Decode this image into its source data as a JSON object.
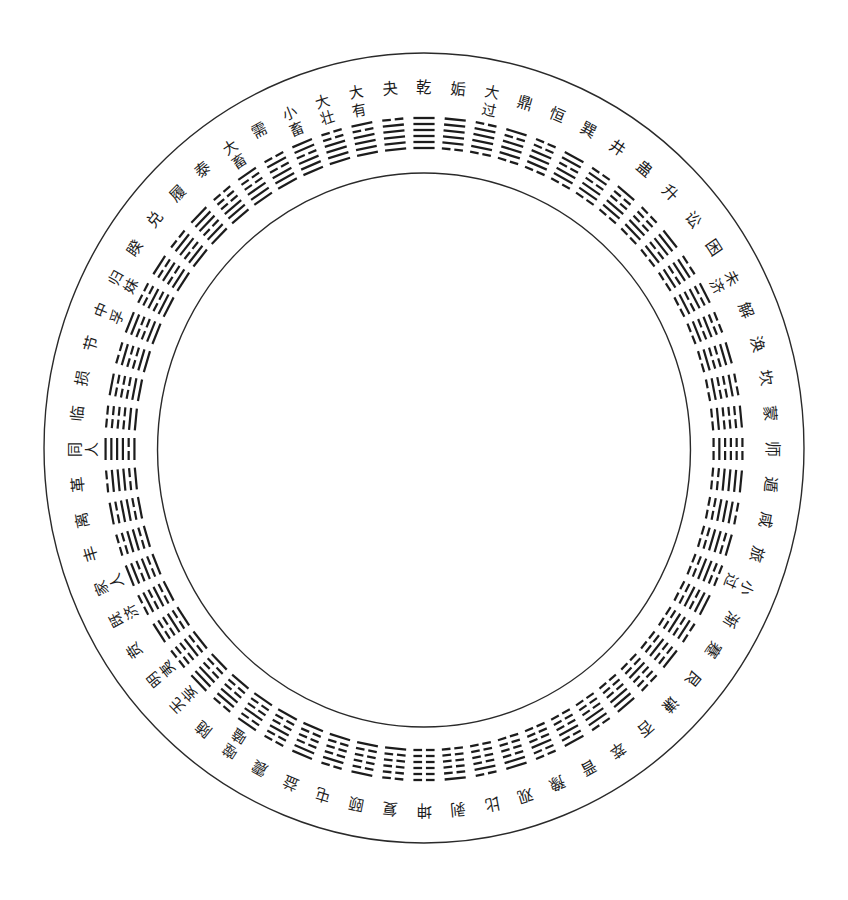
{
  "diagram": {
    "arrangement": "circular, clockwise from top",
    "line_order": "lines strings read bottom-to-top; bottom line faces the circle center"
  },
  "colors": {
    "ink": "#1c1c1c",
    "circle_stroke": "#2a2a2a",
    "background": "#ffffff"
  },
  "hexagrams": [
    {
      "name": "乾",
      "label": [
        "乾"
      ],
      "lines": "111111"
    },
    {
      "name": "姤",
      "label": [
        "姤"
      ],
      "lines": "011111"
    },
    {
      "name": "大过",
      "label": [
        "大",
        "过"
      ],
      "lines": "011110"
    },
    {
      "name": "鼎",
      "label": [
        "鼎"
      ],
      "lines": "011101"
    },
    {
      "name": "恒",
      "label": [
        "恒"
      ],
      "lines": "011100"
    },
    {
      "name": "巽",
      "label": [
        "巽"
      ],
      "lines": "011011"
    },
    {
      "name": "井",
      "label": [
        "井"
      ],
      "lines": "011010"
    },
    {
      "name": "蛊",
      "label": [
        "蛊"
      ],
      "lines": "011001"
    },
    {
      "name": "升",
      "label": [
        "升"
      ],
      "lines": "011000"
    },
    {
      "name": "讼",
      "label": [
        "讼"
      ],
      "lines": "010111"
    },
    {
      "name": "困",
      "label": [
        "困"
      ],
      "lines": "010110"
    },
    {
      "name": "未济",
      "label": [
        "未",
        "济"
      ],
      "lines": "010101"
    },
    {
      "name": "解",
      "label": [
        "解"
      ],
      "lines": "010100"
    },
    {
      "name": "涣",
      "label": [
        "涣"
      ],
      "lines": "010011"
    },
    {
      "name": "坎",
      "label": [
        "坎"
      ],
      "lines": "010010"
    },
    {
      "name": "蒙",
      "label": [
        "蒙"
      ],
      "lines": "010001"
    },
    {
      "name": "师",
      "label": [
        "师"
      ],
      "lines": "010000"
    },
    {
      "name": "遁",
      "label": [
        "遁"
      ],
      "lines": "001111"
    },
    {
      "name": "咸",
      "label": [
        "咸"
      ],
      "lines": "001110"
    },
    {
      "name": "旅",
      "label": [
        "旅"
      ],
      "lines": "001101"
    },
    {
      "name": "小过",
      "label": [
        "小",
        "过"
      ],
      "lines": "001100"
    },
    {
      "name": "渐",
      "label": [
        "渐"
      ],
      "lines": "001011"
    },
    {
      "name": "蹇",
      "label": [
        "蹇"
      ],
      "lines": "001010"
    },
    {
      "name": "艮",
      "label": [
        "艮"
      ],
      "lines": "001001"
    },
    {
      "name": "谦",
      "label": [
        "谦"
      ],
      "lines": "001000"
    },
    {
      "name": "否",
      "label": [
        "否"
      ],
      "lines": "000111"
    },
    {
      "name": "萃",
      "label": [
        "萃"
      ],
      "lines": "000110"
    },
    {
      "name": "晋",
      "label": [
        "晋"
      ],
      "lines": "000101"
    },
    {
      "name": "豫",
      "label": [
        "豫"
      ],
      "lines": "000100"
    },
    {
      "name": "观",
      "label": [
        "观"
      ],
      "lines": "000011"
    },
    {
      "name": "比",
      "label": [
        "比"
      ],
      "lines": "000010"
    },
    {
      "name": "剥",
      "label": [
        "剥"
      ],
      "lines": "000001"
    },
    {
      "name": "坤",
      "label": [
        "坤"
      ],
      "lines": "000000"
    },
    {
      "name": "复",
      "label": [
        "复"
      ],
      "lines": "100000"
    },
    {
      "name": "颐",
      "label": [
        "颐"
      ],
      "lines": "100001"
    },
    {
      "name": "屯",
      "label": [
        "屯"
      ],
      "lines": "100010"
    },
    {
      "name": "益",
      "label": [
        "益"
      ],
      "lines": "100011"
    },
    {
      "name": "震",
      "label": [
        "震"
      ],
      "lines": "100100"
    },
    {
      "name": "噬嗑",
      "label": [
        "噬",
        "嗑"
      ],
      "lines": "100101"
    },
    {
      "name": "随",
      "label": [
        "随"
      ],
      "lines": "100110"
    },
    {
      "name": "无妄",
      "label": [
        "无",
        "妄"
      ],
      "lines": "100111"
    },
    {
      "name": "明夷",
      "label": [
        "明",
        "夷"
      ],
      "lines": "101000"
    },
    {
      "name": "贲",
      "label": [
        "贲"
      ],
      "lines": "101001"
    },
    {
      "name": "既济",
      "label": [
        "既",
        "济"
      ],
      "lines": "101010"
    },
    {
      "name": "家人",
      "label": [
        "家",
        "人"
      ],
      "lines": "101011"
    },
    {
      "name": "丰",
      "label": [
        "丰"
      ],
      "lines": "101100"
    },
    {
      "name": "离",
      "label": [
        "离"
      ],
      "lines": "101101"
    },
    {
      "name": "革",
      "label": [
        "革"
      ],
      "lines": "101110"
    },
    {
      "name": "同人",
      "label": [
        "同",
        "人"
      ],
      "lines": "101111"
    },
    {
      "name": "临",
      "label": [
        "临"
      ],
      "lines": "110000"
    },
    {
      "name": "损",
      "label": [
        "损"
      ],
      "lines": "110001"
    },
    {
      "name": "节",
      "label": [
        "节"
      ],
      "lines": "110010"
    },
    {
      "name": "中孚",
      "label": [
        "中",
        "孚"
      ],
      "lines": "110011"
    },
    {
      "name": "归妹",
      "label": [
        "归",
        "妹"
      ],
      "lines": "110100"
    },
    {
      "name": "睽",
      "label": [
        "睽"
      ],
      "lines": "110101"
    },
    {
      "name": "兑",
      "label": [
        "兑"
      ],
      "lines": "110110"
    },
    {
      "name": "履",
      "label": [
        "履"
      ],
      "lines": "110111"
    },
    {
      "name": "泰",
      "label": [
        "泰"
      ],
      "lines": "111000"
    },
    {
      "name": "大畜",
      "label": [
        "大",
        "畜"
      ],
      "lines": "111001"
    },
    {
      "name": "需",
      "label": [
        "需"
      ],
      "lines": "111010"
    },
    {
      "name": "小畜",
      "label": [
        "小",
        "畜"
      ],
      "lines": "111011"
    },
    {
      "name": "大壮",
      "label": [
        "大",
        "壮"
      ],
      "lines": "111100"
    },
    {
      "name": "大有",
      "label": [
        "大",
        "有"
      ],
      "lines": "111101"
    },
    {
      "name": "夬",
      "label": [
        "夬"
      ],
      "lines": "111110"
    }
  ]
}
